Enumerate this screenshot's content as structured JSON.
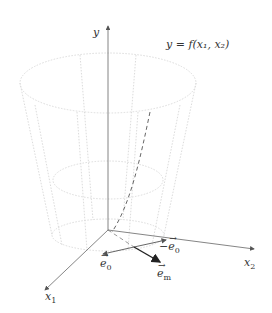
{
  "diagram": {
    "function_label": "y = f(x₁, x₂)",
    "axes": {
      "y": "y",
      "x1": "x",
      "x1_sub": "1",
      "x2": "x",
      "x2_sub": "2"
    },
    "vectors": [
      {
        "name": "e0",
        "label": "e",
        "sub": "0",
        "prefix": ""
      },
      {
        "name": "minus-e0",
        "label": "e",
        "sub": "0",
        "prefix": "−"
      },
      {
        "name": "em",
        "label": "e",
        "sub": "m",
        "prefix": ""
      }
    ],
    "colors": {
      "axis": "#555555",
      "surface": "#d8d8d8",
      "dashed_path": "#666666",
      "em_vector": "#333333"
    }
  }
}
